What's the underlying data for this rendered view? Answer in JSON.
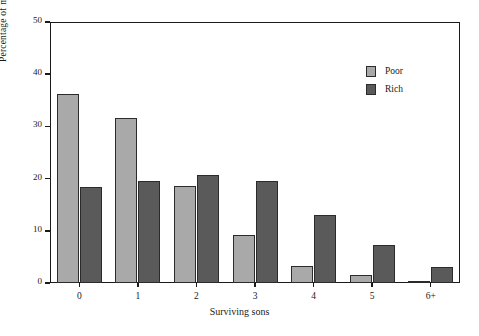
{
  "chart_data": {
    "type": "bar",
    "title": "",
    "xlabel": "Surviving sons",
    "ylabel": "Percentage of married testators",
    "categories": [
      "0",
      "1",
      "2",
      "3",
      "4",
      "5",
      "6+"
    ],
    "series": [
      {
        "name": "Poor",
        "color": "#a9a9a9",
        "values": [
          36.3,
          31.6,
          18.6,
          9.2,
          3.2,
          1.5,
          0.4
        ]
      },
      {
        "name": "Rich",
        "color": "#5a5a5a",
        "values": [
          18.3,
          19.5,
          20.6,
          19.6,
          13.0,
          7.2,
          3.1
        ]
      }
    ],
    "ylim": [
      0,
      50
    ],
    "yticks": [
      0,
      10,
      20,
      30,
      40,
      50
    ],
    "ytick_labels": [
      "0",
      "10",
      "20",
      "30",
      "40",
      "50"
    ],
    "grid": false,
    "legend_position": "top-right",
    "legend": [
      "Poor",
      "Rich"
    ]
  }
}
